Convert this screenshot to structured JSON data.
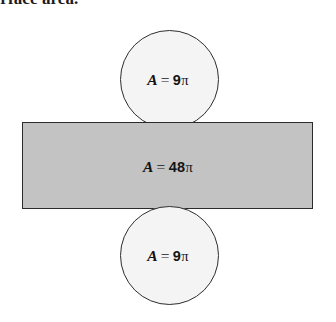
{
  "caption": {
    "text": "surface area."
  },
  "figure": {
    "name": "cylinder-net-diagram",
    "colors": {
      "circle_fill": "#f4f4f4",
      "rectangle_fill": "#c3c3c3",
      "stroke": "#2e2e2e",
      "background": "#ffffff"
    },
    "shapes": [
      {
        "id": "top-circle",
        "type": "circle",
        "label_var": "A",
        "label_eq": "=",
        "label_value": "9",
        "label_unit": "π",
        "label_full": "A = 9π"
      },
      {
        "id": "lateral-rectangle",
        "type": "rectangle",
        "label_var": "A",
        "label_eq": "=",
        "label_value": "48",
        "label_unit": "π",
        "label_full": "A = 48π"
      },
      {
        "id": "bottom-circle",
        "type": "circle",
        "label_var": "A",
        "label_eq": "=",
        "label_value": "9",
        "label_unit": "π",
        "label_full": "A = 9π"
      }
    ]
  }
}
